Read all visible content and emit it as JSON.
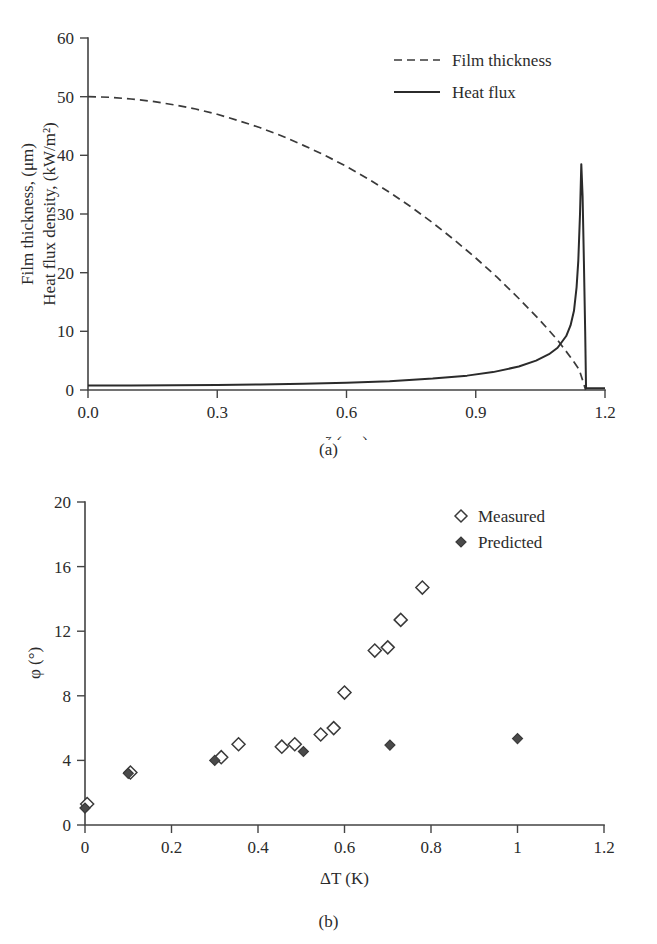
{
  "figure": {
    "panels": [
      {
        "caption": "(a)"
      },
      {
        "caption": "(b)"
      }
    ]
  },
  "chart_data": [
    {
      "type": "line",
      "panel": "(a)",
      "title": "",
      "xlabel": "ζ (cm)",
      "ylabel_line1": "Film thickness, (μm)",
      "ylabel_line2": "Heat flux density, (kW/m²)",
      "xlim": [
        0.0,
        1.2
      ],
      "ylim": [
        0,
        60
      ],
      "xticks": [
        0.0,
        0.3,
        0.6,
        0.9,
        1.2
      ],
      "xticklabels": [
        "0.0",
        "0.3",
        "0.6",
        "0.9",
        "1.2"
      ],
      "yticks": [
        0,
        10,
        20,
        30,
        40,
        50,
        60
      ],
      "yticklabels": [
        "0",
        "10",
        "20",
        "30",
        "40",
        "50",
        "60"
      ],
      "grid": false,
      "legend_position": "top-right",
      "series": [
        {
          "name": "Film thickness",
          "style": "dashed",
          "color": "#3a3a3a",
          "x": [
            0.0,
            0.05,
            0.1,
            0.15,
            0.2,
            0.25,
            0.3,
            0.35,
            0.4,
            0.45,
            0.5,
            0.55,
            0.6,
            0.65,
            0.7,
            0.75,
            0.8,
            0.85,
            0.9,
            0.95,
            1.0,
            1.05,
            1.09,
            1.12,
            1.14,
            1.15,
            1.155
          ],
          "values": [
            50.0,
            49.9,
            49.6,
            49.2,
            48.6,
            47.9,
            47.0,
            45.9,
            44.7,
            43.3,
            41.7,
            40.0,
            38.1,
            36.0,
            33.7,
            31.2,
            28.5,
            25.6,
            22.5,
            19.2,
            15.6,
            11.8,
            8.5,
            5.6,
            3.5,
            1.2,
            0.0
          ]
        },
        {
          "name": "Heat flux",
          "style": "solid",
          "color": "#2b2b2b",
          "x": [
            0.0,
            0.1,
            0.2,
            0.3,
            0.4,
            0.5,
            0.6,
            0.7,
            0.8,
            0.88,
            0.94,
            1.0,
            1.04,
            1.07,
            1.09,
            1.11,
            1.12,
            1.128,
            1.134,
            1.138,
            1.142,
            1.145,
            1.148,
            1.151,
            1.154,
            1.156,
            1.2
          ],
          "values": [
            0.75,
            0.76,
            0.8,
            0.85,
            0.93,
            1.05,
            1.22,
            1.5,
            1.95,
            2.45,
            3.05,
            4.0,
            5.0,
            6.1,
            7.2,
            9.2,
            11.0,
            13.5,
            17.5,
            22.0,
            30.0,
            38.5,
            33.0,
            22.0,
            10.0,
            0.3,
            0.3
          ]
        }
      ],
      "legend": [
        {
          "label": "Film thickness",
          "style": "dashed"
        },
        {
          "label": "Heat flux",
          "style": "solid"
        }
      ]
    },
    {
      "type": "scatter",
      "panel": "(b)",
      "title": "",
      "xlabel": "ΔT (K)",
      "ylabel": "φ (°)",
      "xlim": [
        0,
        1.2
      ],
      "ylim": [
        0,
        20
      ],
      "xticks": [
        0,
        0.2,
        0.4,
        0.6,
        0.8,
        1,
        1.2
      ],
      "xticklabels": [
        "0",
        "0.2",
        "0.4",
        "0.6",
        "0.8",
        "1",
        "1.2"
      ],
      "yticks": [
        0,
        4,
        8,
        12,
        16,
        20
      ],
      "yticklabels": [
        "0",
        "4",
        "8",
        "12",
        "16",
        "20"
      ],
      "grid": false,
      "legend_position": "top-right",
      "series": [
        {
          "name": "Measured",
          "marker": "open-diamond",
          "points": [
            {
              "x": 0.005,
              "y": 1.3
            },
            {
              "x": 0.105,
              "y": 3.25
            },
            {
              "x": 0.315,
              "y": 4.2
            },
            {
              "x": 0.355,
              "y": 5.0
            },
            {
              "x": 0.455,
              "y": 4.85
            },
            {
              "x": 0.485,
              "y": 5.0
            },
            {
              "x": 0.545,
              "y": 5.6
            },
            {
              "x": 0.575,
              "y": 6.0
            },
            {
              "x": 0.6,
              "y": 8.2
            },
            {
              "x": 0.67,
              "y": 10.8
            },
            {
              "x": 0.7,
              "y": 11.0
            },
            {
              "x": 0.73,
              "y": 12.7
            },
            {
              "x": 0.78,
              "y": 14.7
            }
          ]
        },
        {
          "name": "Predicted",
          "marker": "filled-diamond",
          "points": [
            {
              "x": 0.0,
              "y": 1.05
            },
            {
              "x": 0.1,
              "y": 3.2
            },
            {
              "x": 0.3,
              "y": 4.0
            },
            {
              "x": 0.505,
              "y": 4.55
            },
            {
              "x": 0.705,
              "y": 4.95
            },
            {
              "x": 1.0,
              "y": 5.35
            }
          ]
        }
      ],
      "legend": [
        {
          "label": "Measured",
          "marker": "open-diamond"
        },
        {
          "label": "Predicted",
          "marker": "filled-diamond"
        }
      ]
    }
  ]
}
